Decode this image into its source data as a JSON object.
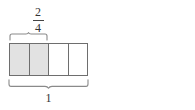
{
  "figure": {
    "type": "fraction-bar-comparison"
  },
  "diagrams": [
    {
      "id": "left",
      "fraction": {
        "numerator": "2",
        "denominator": "4"
      },
      "whole_label": "1",
      "cells": [
        {
          "shaded": true,
          "dashed_mid": false
        },
        {
          "shaded": true,
          "dashed_mid": false
        },
        {
          "shaded": false,
          "dashed_mid": false
        },
        {
          "shaded": false,
          "dashed_mid": false
        }
      ],
      "top_brace_covers_cells": 2,
      "bottom_brace_covers_cells": 4
    },
    {
      "id": "right",
      "fraction": {
        "numerator": "1",
        "denominator": "2"
      },
      "whole_label": "1",
      "cells": [
        {
          "shaded": true,
          "dashed_mid": true
        },
        {
          "shaded": false,
          "dashed_mid": true
        }
      ],
      "top_brace_covers_cells": 1,
      "bottom_brace_covers_cells": 2
    }
  ],
  "colors": {
    "shade_fill": "#e2e2e2",
    "stroke": "#6e6e6e",
    "dash_stroke": "#777777",
    "text": "#333333",
    "background": "#ffffff"
  }
}
